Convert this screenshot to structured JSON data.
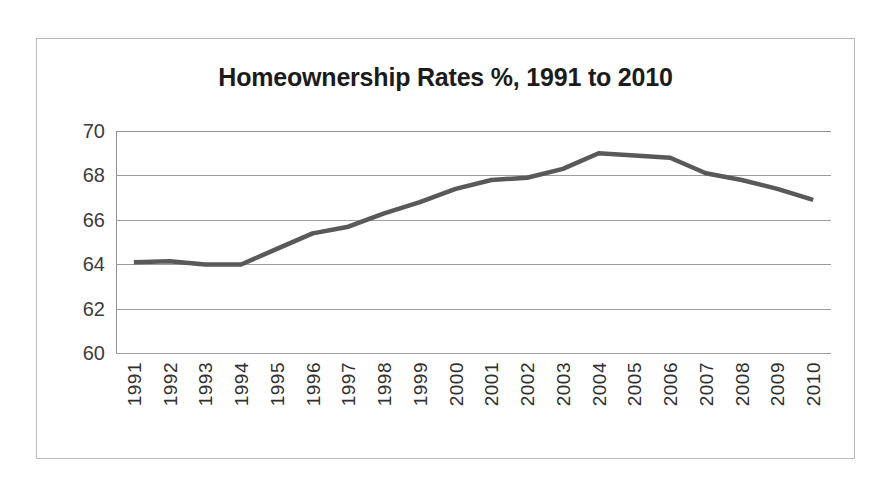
{
  "chart_data": {
    "type": "line",
    "title": "Homeownership Rates %, 1991 to 2010",
    "xlabel": "",
    "ylabel": "",
    "categories": [
      "1991",
      "1992",
      "1993",
      "1994",
      "1995",
      "1996",
      "1997",
      "1998",
      "1999",
      "2000",
      "2001",
      "2002",
      "2003",
      "2004",
      "2005",
      "2006",
      "2007",
      "2008",
      "2009",
      "2010"
    ],
    "values": [
      64.1,
      64.15,
      64.0,
      64.0,
      64.7,
      65.4,
      65.7,
      66.3,
      66.8,
      67.4,
      67.8,
      67.9,
      68.3,
      69.0,
      68.9,
      68.8,
      68.1,
      67.8,
      67.4,
      66.9
    ],
    "ylim": [
      60,
      70
    ],
    "yticks": [
      60,
      62,
      64,
      66,
      68,
      70
    ],
    "ytick_labels": [
      "60",
      "62",
      "64",
      "66",
      "68",
      "70"
    ],
    "grid": true,
    "legend": false,
    "series_color": "#595959",
    "gridline_color": "#9c9c9c",
    "frame_color": "#b9b9b9",
    "title_color": "#1b1b1b"
  }
}
